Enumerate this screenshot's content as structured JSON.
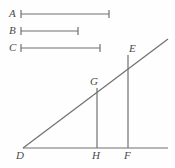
{
  "figure": {
    "background_color": "#fefefe",
    "stroke_color": "#707070",
    "label_color": "#4a4a4a",
    "width": 175,
    "height": 168
  },
  "comparison_segments": [
    {
      "label": "A",
      "label_x": 9,
      "label_y": 8,
      "y": 14,
      "x1": 21,
      "x2": 109,
      "tick_half_height": 4
    },
    {
      "label": "B",
      "label_x": 9,
      "label_y": 25,
      "y": 31,
      "x1": 21,
      "x2": 78,
      "tick_half_height": 4
    },
    {
      "label": "C",
      "label_x": 9,
      "label_y": 42,
      "y": 48,
      "x1": 21,
      "x2": 100,
      "tick_half_height": 4
    }
  ],
  "diagram": {
    "points": [
      {
        "name": "D",
        "x": 23,
        "y": 148,
        "label": "D",
        "label_x": 16,
        "label_y": 150
      },
      {
        "name": "H",
        "x": 97,
        "y": 148,
        "label": "H",
        "label_x": 92,
        "label_y": 150
      },
      {
        "name": "F",
        "x": 128,
        "y": 148,
        "label": "F",
        "label_x": 124,
        "label_y": 150
      },
      {
        "name": "G",
        "x": 97,
        "y": 88,
        "label": "G",
        "label_x": 90,
        "label_y": 76
      },
      {
        "name": "E",
        "x": 128,
        "y": 55,
        "label": "E",
        "label_x": 129,
        "label_y": 43
      }
    ],
    "lines": [
      {
        "name": "baseline-DF",
        "x1": 23,
        "y1": 148,
        "x2": 168,
        "y2": 148
      },
      {
        "name": "ray-DE",
        "x1": 23,
        "y1": 148,
        "x2": 168,
        "y2": 39
      },
      {
        "name": "perpendicular-GH",
        "x1": 97,
        "y1": 88,
        "x2": 97,
        "y2": 148
      },
      {
        "name": "perpendicular-EF",
        "x1": 128,
        "y1": 55,
        "x2": 128,
        "y2": 148
      }
    ]
  }
}
